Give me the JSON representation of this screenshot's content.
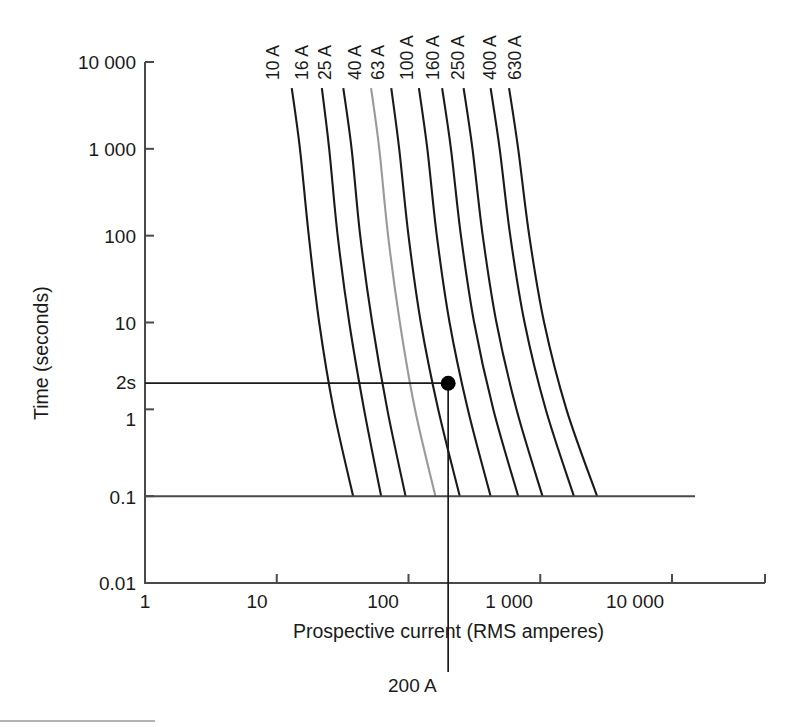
{
  "chart_data": {
    "type": "line",
    "title": "",
    "xlabel": "Prospective current (RMS amperes)",
    "ylabel": "Time (seconds)",
    "xscale": "log",
    "yscale": "log",
    "xlim": [
      1,
      30000
    ],
    "ylim": [
      0.01,
      10000
    ],
    "grid": false,
    "legend_position": "curve-labels-top",
    "xticklabels": [
      "1",
      "10",
      "100",
      "1 000",
      "10 000"
    ],
    "xtickvalues": [
      1,
      10,
      100,
      1000,
      10000
    ],
    "yticklabels": [
      "10 000",
      "1 000",
      "100",
      "10",
      "1",
      "0.1",
      "0.01"
    ],
    "ytickvalues": [
      10000,
      1000,
      100,
      10,
      1,
      0.1,
      0.01
    ],
    "series": [
      {
        "name": "10 A",
        "rating_amps": 10,
        "color": "#1a1a1a",
        "highlight": false,
        "points": [
          [
            13.0,
            5000
          ],
          [
            15.0,
            1000
          ],
          [
            17.5,
            100
          ],
          [
            21.0,
            10
          ],
          [
            27.0,
            1
          ],
          [
            38.0,
            0.1
          ]
        ]
      },
      {
        "name": "16 A",
        "rating_amps": 16,
        "color": "#1a1a1a",
        "highlight": false,
        "points": [
          [
            22.0,
            5000
          ],
          [
            25.0,
            1000
          ],
          [
            29.0,
            100
          ],
          [
            35.5,
            10
          ],
          [
            46.0,
            1
          ],
          [
            62.0,
            0.1
          ]
        ]
      },
      {
        "name": "25 A",
        "rating_amps": 25,
        "color": "#1a1a1a",
        "highlight": false,
        "points": [
          [
            32.0,
            5000
          ],
          [
            37.0,
            1000
          ],
          [
            43.0,
            100
          ],
          [
            53.0,
            10
          ],
          [
            69.0,
            1
          ],
          [
            95.0,
            0.1
          ]
        ]
      },
      {
        "name": "40 A",
        "rating_amps": 40,
        "color": "#9a9a9a",
        "highlight": true,
        "points": [
          [
            52.0,
            5000
          ],
          [
            60.0,
            1000
          ],
          [
            70.0,
            100
          ],
          [
            86.0,
            10
          ],
          [
            112.0,
            1
          ],
          [
            160.0,
            0.1
          ]
        ]
      },
      {
        "name": "63 A",
        "rating_amps": 63,
        "color": "#1a1a1a",
        "highlight": false,
        "points": [
          [
            74.0,
            5000
          ],
          [
            85.0,
            1000
          ],
          [
            100.0,
            100
          ],
          [
            124.0,
            10
          ],
          [
            168.0,
            1
          ],
          [
            245.0,
            0.1
          ]
        ]
      },
      {
        "name": "100 A",
        "rating_amps": 100,
        "color": "#1a1a1a",
        "highlight": false,
        "points": [
          [
            120.0,
            5000
          ],
          [
            139.0,
            1000
          ],
          [
            164.0,
            100
          ],
          [
            205.0,
            10
          ],
          [
            282.0,
            1
          ],
          [
            420.0,
            0.1
          ]
        ]
      },
      {
        "name": "160 A",
        "rating_amps": 160,
        "color": "#1a1a1a",
        "highlight": false,
        "points": [
          [
            180.0,
            5000
          ],
          [
            210.0,
            1000
          ],
          [
            250.0,
            100
          ],
          [
            315.0,
            10
          ],
          [
            440.0,
            1
          ],
          [
            680.0,
            0.1
          ]
        ]
      },
      {
        "name": "250 A",
        "rating_amps": 250,
        "color": "#1a1a1a",
        "highlight": false,
        "points": [
          [
            262.0,
            5000
          ],
          [
            306.0,
            1000
          ],
          [
            366.0,
            100
          ],
          [
            465.0,
            10
          ],
          [
            660.0,
            1
          ],
          [
            1040.0,
            0.1
          ]
        ]
      },
      {
        "name": "400 A",
        "rating_amps": 400,
        "color": "#1a1a1a",
        "highlight": false,
        "points": [
          [
            420.0,
            5000
          ],
          [
            492.0,
            1000
          ],
          [
            592.0,
            100
          ],
          [
            760.0,
            10
          ],
          [
            1100.0,
            1
          ],
          [
            1800.0,
            0.1
          ]
        ]
      },
      {
        "name": "630 A",
        "rating_amps": 630,
        "color": "#1a1a1a",
        "highlight": false,
        "points": [
          [
            580.0,
            5000
          ],
          [
            680.0,
            1000
          ],
          [
            825.0,
            100
          ],
          [
            1070.0,
            10
          ],
          [
            1580.0,
            1
          ],
          [
            2700.0,
            0.1
          ]
        ]
      }
    ],
    "annotations": {
      "y_marker_label": "2s",
      "y_marker_value": 2,
      "x_marker_label": "200 A",
      "x_marker_value": 200,
      "operating_point": {
        "current": 200,
        "time": 2,
        "marker": "filled-circle"
      },
      "reference_line_label": "0.1"
    }
  },
  "yaxis": {
    "title": "Time (seconds)",
    "ticks": [
      {
        "label": "10 000",
        "value": 10000
      },
      {
        "label": "1 000",
        "value": 1000
      },
      {
        "label": "100",
        "value": 100
      },
      {
        "label": "10",
        "value": 10
      },
      {
        "label": "1",
        "value": 1
      },
      {
        "label": "0.1",
        "value": 0.1
      },
      {
        "label": "0.01",
        "value": 0.01
      }
    ],
    "marker_label": "2s"
  },
  "xaxis": {
    "title": "Prospective current (RMS amperes)",
    "ticks": [
      {
        "label": "1",
        "value": 1
      },
      {
        "label": "10",
        "value": 10
      },
      {
        "label": "100",
        "value": 100
      },
      {
        "label": "1 000",
        "value": 1000
      },
      {
        "label": "10 000",
        "value": 10000
      }
    ],
    "marker_label": "200 A"
  },
  "curve_labels": [
    {
      "label": "10 A"
    },
    {
      "label": "16 A"
    },
    {
      "label": "25 A"
    },
    {
      "label": "40 A"
    },
    {
      "label": "63 A"
    },
    {
      "label": "100 A"
    },
    {
      "label": "160 A"
    },
    {
      "label": "250 A"
    },
    {
      "label": "400 A"
    },
    {
      "label": "630 A"
    }
  ],
  "colors": {
    "curve": "#1a1a1a",
    "curve_highlight": "#9a9a9a",
    "axis": "#4a4a4a",
    "guide": "#1a1a1a",
    "background": "#ffffff"
  }
}
